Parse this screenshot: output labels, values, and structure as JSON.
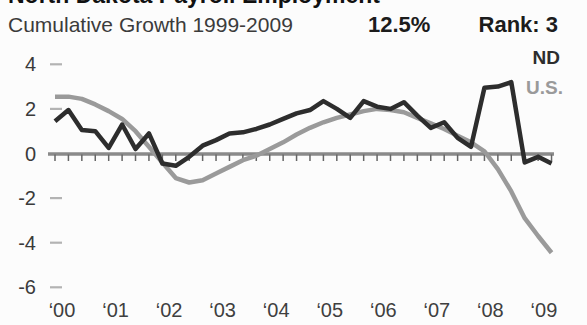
{
  "header": {
    "title": "North Dakota Payroll Employment",
    "subtitle": "Cumulative Growth 1999-2009",
    "growth_value": "12.5%",
    "rank": "Rank: 3"
  },
  "legend": {
    "nd": "ND",
    "us": "U.S."
  },
  "colors": {
    "nd_line": "#2d2d2d",
    "us_line": "#9a9a9a",
    "zero_line": "#8a8a8a",
    "quarter_tick": "#666666",
    "y_dash": "#b3b3b3",
    "text_dark": "#1c1c1c",
    "text_gray": "#3b3b3b"
  },
  "chart_data": {
    "type": "line",
    "title": "North Dakota Payroll Employment",
    "subtitle": "Cumulative Growth 1999-2009",
    "cumulative_growth_1999_2009": "12.5%",
    "rank": 3,
    "x_unit": "quarters",
    "x_start": "2000 Q1",
    "x_end": "2009 Q2",
    "x_tick_labels": [
      "‘00",
      "‘01",
      "‘02",
      "‘03",
      "‘04",
      "‘05",
      "‘06",
      "‘07",
      "‘08",
      "‘09"
    ],
    "y_ticks": [
      4,
      2,
      0,
      -2,
      -4,
      -6
    ],
    "ylim": [
      -6,
      4.5
    ],
    "grid": "zero-line-with-quarterly-ticks",
    "legend_position": "top-right",
    "series": [
      {
        "name": "ND",
        "color": "#2d2d2d",
        "values": [
          1.45,
          1.95,
          1.05,
          1.0,
          0.25,
          1.3,
          0.2,
          0.9,
          -0.45,
          -0.55,
          -0.15,
          0.35,
          0.6,
          0.9,
          0.95,
          1.1,
          1.3,
          1.55,
          1.8,
          1.95,
          2.35,
          2.0,
          1.6,
          2.35,
          2.1,
          2.0,
          2.3,
          1.7,
          1.15,
          1.4,
          0.7,
          0.3,
          2.95,
          3.0,
          3.2,
          -0.4,
          -0.15,
          -0.45
        ]
      },
      {
        "name": "U.S.",
        "color": "#9a9a9a",
        "values": [
          2.55,
          2.55,
          2.45,
          2.2,
          1.9,
          1.55,
          1.0,
          0.3,
          -0.4,
          -1.1,
          -1.3,
          -1.2,
          -0.9,
          -0.6,
          -0.3,
          -0.1,
          0.2,
          0.5,
          0.85,
          1.15,
          1.4,
          1.6,
          1.75,
          1.9,
          2.0,
          1.95,
          1.85,
          1.6,
          1.35,
          1.1,
          0.8,
          0.5,
          0.1,
          -0.7,
          -1.7,
          -2.9,
          -3.7,
          -4.45
        ]
      }
    ]
  }
}
